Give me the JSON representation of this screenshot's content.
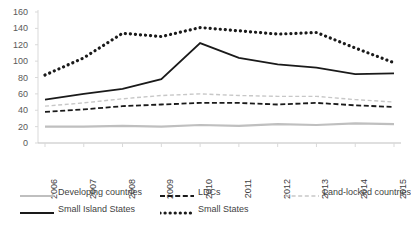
{
  "chart_data": {
    "type": "line",
    "title": "",
    "subtitle": "",
    "xlabel": "",
    "ylabel": "",
    "categories": [
      "2006",
      "2007",
      "2008",
      "2009",
      "2010",
      "2011",
      "2012",
      "2013",
      "2014",
      "2015"
    ],
    "x": [
      2006,
      2007,
      2008,
      2009,
      2010,
      2011,
      2012,
      2013,
      2014,
      2015
    ],
    "ylim": [
      0,
      160
    ],
    "xlim": [
      2006,
      2015
    ],
    "yticks": [
      0,
      20,
      40,
      60,
      80,
      100,
      120,
      140,
      160
    ],
    "ytick_labels": [
      "0",
      "20",
      "40",
      "60",
      "80",
      "100",
      "120",
      "140",
      "160"
    ],
    "grid": false,
    "legend_position": "bottom",
    "series": [
      {
        "name": "Developing countries",
        "style": "solid",
        "color": "#BFBFBF",
        "width": 2.2,
        "values": [
          20,
          20,
          21,
          20,
          22,
          21,
          23,
          22,
          24,
          23
        ]
      },
      {
        "name": "LDCs",
        "style": "dashed",
        "color": "#1A1A1A",
        "width": 1.8,
        "values": [
          38,
          41,
          45,
          47,
          49,
          49,
          47,
          49,
          46,
          44
        ]
      },
      {
        "name": "Land-locked countries",
        "style": "dashed",
        "color": "#C7C7C7",
        "width": 1.4,
        "values": [
          45,
          49,
          54,
          58,
          60,
          58,
          57,
          57,
          53,
          50
        ]
      },
      {
        "name": "Small Island States",
        "style": "solid",
        "color": "#1A1A1A",
        "width": 1.8,
        "values": [
          53,
          60,
          66,
          78,
          122,
          104,
          96,
          92,
          84,
          85
        ]
      },
      {
        "name": "Small States",
        "style": "dotted",
        "color": "#1A1A1A",
        "width": 3.2,
        "values": [
          83,
          104,
          134,
          130,
          141,
          137,
          133,
          135,
          116,
          98
        ]
      }
    ]
  },
  "legend": {
    "rows": [
      [
        {
          "label": "Developing countries",
          "series": 0
        },
        {
          "label": "LDCs",
          "series": 1
        },
        {
          "label": "Land-locked countries",
          "series": 2
        }
      ],
      [
        {
          "label": "Small Island States",
          "series": 3
        },
        {
          "label": "Small States",
          "series": 4
        }
      ]
    ]
  },
  "axes": {
    "y_color": "#D9D9D9",
    "x_color": "#BFBFBF",
    "tick_color": "#D9D9D9"
  }
}
